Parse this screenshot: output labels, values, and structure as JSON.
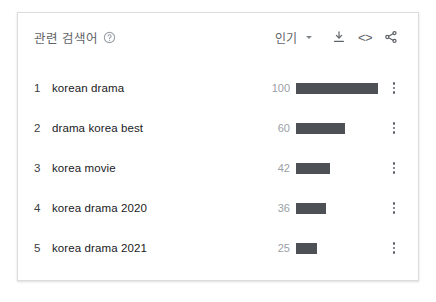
{
  "card": {
    "header": {
      "title": "관련 검색어",
      "help_icon": "help-circle-icon",
      "sort_label": "인기",
      "sort_caret_icon": "chevron-down-icon",
      "download_icon": "download-icon",
      "embed_icon": "embed-code-icon",
      "embed_glyph": "<>",
      "share_icon": "share-icon"
    },
    "rows": [
      {
        "rank": "1",
        "term": "korean drama",
        "value": "100"
      },
      {
        "rank": "2",
        "term": "drama korea best",
        "value": "60"
      },
      {
        "rank": "3",
        "term": "korea movie",
        "value": "42"
      },
      {
        "rank": "4",
        "term": "korea drama 2020",
        "value": "36"
      },
      {
        "rank": "5",
        "term": "korea drama 2021",
        "value": "25"
      }
    ],
    "menu_icon": "more-vertical-icon"
  },
  "colors": {
    "bar": "#4d5156",
    "border": "#dadce0",
    "value_text": "#9aa0a6",
    "term_text": "#202124",
    "header_text": "#5f6368",
    "background": "#ffffff"
  },
  "chart_data": {
    "type": "bar",
    "title": "관련 검색어",
    "categories": [
      "korean drama",
      "drama korea best",
      "korea movie",
      "korea drama 2020",
      "korea drama 2021"
    ],
    "values": [
      100,
      60,
      42,
      36,
      25
    ],
    "ranks": [
      1,
      2,
      3,
      4,
      5
    ],
    "xlabel": "",
    "ylabel": "",
    "xlim": [
      0,
      100
    ],
    "orientation": "horizontal",
    "grid": false,
    "legend": false,
    "sort": "인기"
  }
}
